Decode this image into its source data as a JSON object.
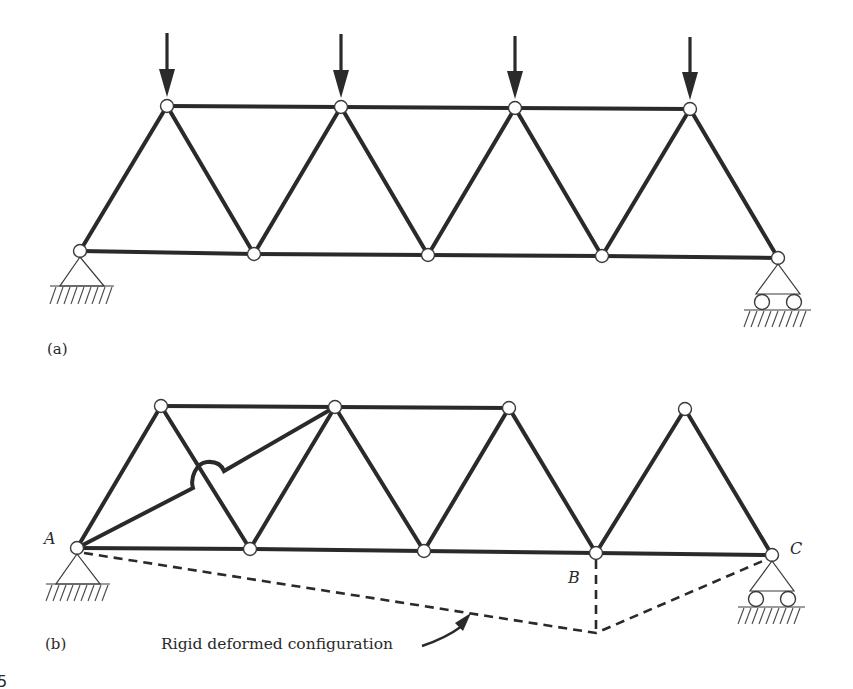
{
  "figure": {
    "number_fragment": "5",
    "panels": [
      {
        "id": "a",
        "label": "(a)",
        "description": "Simply supported Warren truss with four downward point loads at the top chord joints; pin support at left, roller support at right",
        "loads": 4,
        "top_nodes": 4,
        "bottom_nodes": 5
      },
      {
        "id": "b",
        "label": "(b)",
        "description": "Same truss with one diagonal removed and a member added from A to the second top joint; mechanism showing rigid deformed configuration",
        "points": {
          "A": "A",
          "B": "B",
          "C": "C"
        },
        "annotation": "Rigid deformed configuration"
      }
    ],
    "colors": {
      "member": "#2a2a2a",
      "background": "#ffffff"
    }
  }
}
